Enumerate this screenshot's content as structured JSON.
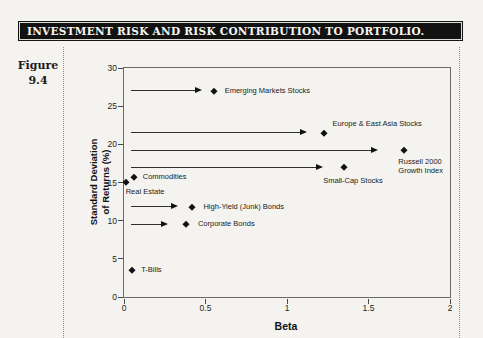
{
  "page": {
    "background": "#f4f3ef"
  },
  "header": {
    "title": "INVESTMENT RISK AND RISK CONTRIBUTION TO PORTFOLIO.",
    "bar_color": "#121212",
    "text_color": "#f5f5f0"
  },
  "figure_label": {
    "word": "Figure",
    "number": "9.4"
  },
  "chart_data": {
    "type": "scatter",
    "title": "",
    "xlabel": "Beta",
    "ylabel": "Standard Deviation of Returns (%)",
    "ylabel_lines": [
      "Standard Deviation",
      "of Returns (%)"
    ],
    "xlim": [
      0,
      2
    ],
    "ylim": [
      0,
      30
    ],
    "xticks": [
      0,
      0.5,
      1,
      1.5,
      2
    ],
    "yticks": [
      0,
      5,
      10,
      15,
      20,
      25,
      30
    ],
    "grid": false,
    "point_color": "#111111",
    "points": [
      {
        "name": "T-Bills",
        "label_lines": [
          "T-Bills"
        ],
        "beta": 0.05,
        "sd": 3.5,
        "arrow": null,
        "label_offset": {
          "dx": 9,
          "dy": -5,
          "align": "left"
        }
      },
      {
        "name": "Corporate Bonds",
        "label_lines": [
          "Corporate Bonds"
        ],
        "beta": 0.38,
        "sd": 9.5,
        "arrow": {
          "from": 0.04,
          "to": 0.27
        },
        "label_offset": {
          "dx": 12,
          "dy": -5,
          "align": "left"
        }
      },
      {
        "name": "High-Yield (Junk) Bonds",
        "label_lines": [
          "High-Yield (Junk) Bonds"
        ],
        "beta": 0.42,
        "sd": 11.8,
        "arrow": {
          "from": 0.04,
          "to": 0.33
        },
        "label_offset": {
          "dx": 11,
          "dy": -5,
          "align": "left"
        }
      },
      {
        "name": "Real Estate",
        "label_lines": [
          "Real Estate"
        ],
        "beta": 0.01,
        "sd": 15.1,
        "arrow": null,
        "label_offset": {
          "dx": 0,
          "dy": 5,
          "align": "left"
        }
      },
      {
        "name": "Commodities",
        "label_lines": [
          "Commodities"
        ],
        "beta": 0.06,
        "sd": 15.7,
        "arrow": null,
        "label_offset": {
          "dx": 9,
          "dy": -5,
          "align": "left"
        }
      },
      {
        "name": "Small-Cap Stocks",
        "label_lines": [
          "Small-Cap Stocks"
        ],
        "beta": 1.35,
        "sd": 17.0,
        "arrow": {
          "from": 0.04,
          "to": 1.22
        },
        "label_offset": {
          "dx": 9,
          "dy": 9,
          "align": "center"
        }
      },
      {
        "name": "Russell 2000 Growth Index",
        "label_lines": [
          "Russell 2000",
          "Growth Index"
        ],
        "beta": 1.72,
        "sd": 19.2,
        "arrow": {
          "from": 0.04,
          "to": 1.56
        },
        "label_offset": {
          "dx": -6,
          "dy": 7,
          "align": "left"
        }
      },
      {
        "name": "Europe & East Asia Stocks",
        "label_lines": [
          "Europe & East Asia Stocks"
        ],
        "beta": 1.23,
        "sd": 21.5,
        "arrow": {
          "from": 0.04,
          "to": 1.12
        },
        "label_offset": {
          "dx": 8,
          "dy": -14,
          "align": "left"
        }
      },
      {
        "name": "Emerging Markets Stocks",
        "label_lines": [
          "Emerging Markets Stocks"
        ],
        "beta": 0.55,
        "sd": 27.0,
        "arrow": {
          "from": 0.04,
          "to": 0.48
        },
        "label_offset": {
          "dx": 11,
          "dy": -5,
          "align": "left"
        }
      }
    ]
  }
}
